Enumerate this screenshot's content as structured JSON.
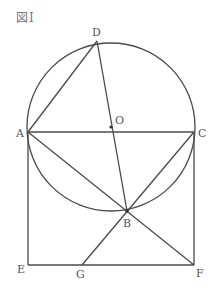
{
  "figure": {
    "title": "図Ⅰ"
  },
  "diagram": {
    "points": {
      "A": {
        "label": "A"
      },
      "B": {
        "label": "B"
      },
      "C": {
        "label": "C"
      },
      "D": {
        "label": "D"
      },
      "E": {
        "label": "E"
      },
      "F": {
        "label": "F"
      },
      "G": {
        "label": "G"
      },
      "O": {
        "label": "O"
      }
    },
    "segments": [
      [
        "A",
        "C"
      ],
      [
        "A",
        "D"
      ],
      [
        "D",
        "B"
      ],
      [
        "A",
        "E"
      ],
      [
        "E",
        "F"
      ],
      [
        "F",
        "C"
      ],
      [
        "A",
        "F"
      ],
      [
        "C",
        "G"
      ],
      [
        "A",
        "B"
      ],
      [
        "C",
        "B"
      ]
    ],
    "circle": {
      "center": "O",
      "passes_through": [
        "A",
        "C",
        "D",
        "B"
      ]
    },
    "marked_points": [
      "O",
      "B"
    ],
    "line_color": "#4a4a4a",
    "label_color": "#555555"
  }
}
